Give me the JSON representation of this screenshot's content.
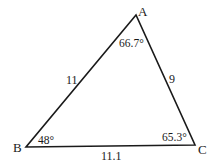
{
  "figure": {
    "type": "triangle",
    "vertices": [
      {
        "name": "A",
        "label": "A",
        "x": 136,
        "y": 15
      },
      {
        "name": "B",
        "label": "B",
        "x": 26,
        "y": 147
      },
      {
        "name": "C",
        "label": "C",
        "x": 195,
        "y": 145
      }
    ],
    "sides": {
      "AB": "11",
      "AC": "9",
      "BC": "11.1"
    },
    "angles": {
      "A": "66.7°",
      "B": "48°",
      "C": "65.3°"
    },
    "stroke_color": "#1a1a1a"
  }
}
